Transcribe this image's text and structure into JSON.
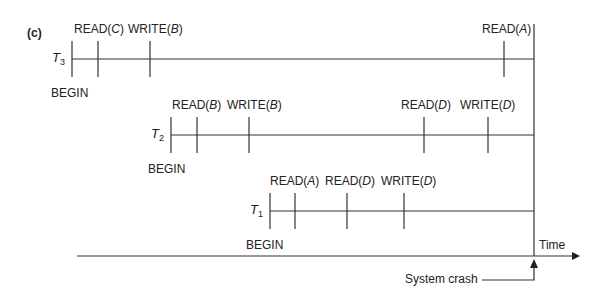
{
  "figure": {
    "part_label": "(c)",
    "axis_label": "Time",
    "crash_label": "System crash",
    "line_color": "#333333"
  },
  "transactions": [
    {
      "name": "T",
      "sub": "3",
      "begin_label": "BEGIN",
      "events": [
        {
          "op": "READ",
          "item": "C"
        },
        {
          "op": "WRITE",
          "item": "B"
        },
        {
          "op": "READ",
          "item": "A"
        }
      ]
    },
    {
      "name": "T",
      "sub": "2",
      "begin_label": "BEGIN",
      "events": [
        {
          "op": "READ",
          "item": "B"
        },
        {
          "op": "WRITE",
          "item": "B"
        },
        {
          "op": "READ",
          "item": "D"
        },
        {
          "op": "WRITE",
          "item": "D"
        }
      ]
    },
    {
      "name": "T",
      "sub": "1",
      "begin_label": "BEGIN",
      "events": [
        {
          "op": "READ",
          "item": "A"
        },
        {
          "op": "READ",
          "item": "D"
        },
        {
          "op": "WRITE",
          "item": "D"
        }
      ]
    }
  ]
}
